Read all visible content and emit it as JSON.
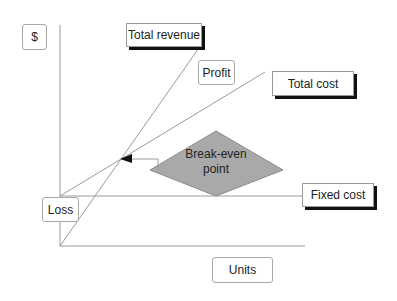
{
  "diagram": {
    "axis_labels": {
      "y": "$",
      "x": "Units"
    },
    "line_labels": {
      "total_revenue": "Total revenue",
      "total_cost": "Total cost",
      "fixed_cost": "Fixed cost"
    },
    "region_labels": {
      "profit": "Profit",
      "loss": "Loss"
    },
    "callout": {
      "line1": "Break-even",
      "line2": "point"
    },
    "colors": {
      "lines": "#9a9a9a",
      "diamond_fill": "#a9a9a9",
      "shadow": "#111111"
    }
  }
}
